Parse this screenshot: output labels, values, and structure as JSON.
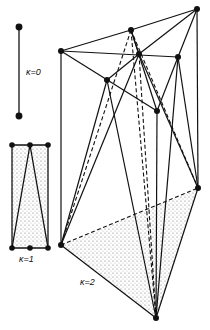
{
  "labels": {
    "k0": "κ=0",
    "k1": "κ=1",
    "k2": "κ=2"
  },
  "colors": {
    "ink": "#111111",
    "background": "#ffffff",
    "stipple": "#555555"
  },
  "diagram": {
    "k0": {
      "vertices": [
        [
          19,
          27
        ],
        [
          19,
          116
        ]
      ],
      "edges": [
        [
          0,
          1
        ]
      ]
    },
    "k1": {
      "vertices": [
        [
          12,
          145
        ],
        [
          30,
          145
        ],
        [
          48,
          145
        ],
        [
          12,
          248
        ],
        [
          30,
          248
        ],
        [
          48,
          248
        ]
      ],
      "edges": [
        [
          0,
          2
        ],
        [
          3,
          5
        ],
        [
          0,
          3
        ],
        [
          2,
          5
        ],
        [
          1,
          3
        ],
        [
          1,
          5
        ]
      ],
      "shaded": "rectangle"
    },
    "k2": {
      "vertices": {
        "top_right": [
          197,
          9
        ],
        "upper_mid": [
          131,
          30
        ],
        "left_top": [
          61,
          51
        ],
        "center": [
          139,
          54
        ],
        "right": [
          178,
          57
        ],
        "mid_left": [
          107,
          80
        ],
        "lower_mid": [
          157,
          111
        ],
        "right_low": [
          198,
          188
        ],
        "left_bottom": [
          61,
          245
        ],
        "bottom": [
          156,
          318
        ]
      },
      "shaded_triangle": [
        "left_bottom",
        "right_low",
        "bottom"
      ]
    }
  }
}
